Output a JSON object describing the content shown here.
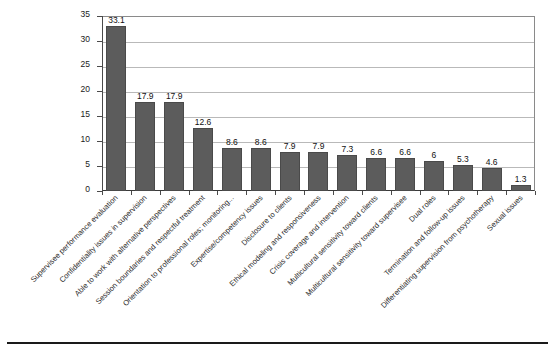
{
  "chart_data": {
    "type": "bar",
    "title": "",
    "subtitle": "",
    "xlabel": "",
    "ylabel": "",
    "ylim": [
      0,
      35
    ],
    "yticks": [
      0,
      5,
      10,
      15,
      20,
      25,
      30,
      35
    ],
    "grid": true,
    "legend": null,
    "orientation": "vertical",
    "bar_color": "#5c5c5c",
    "value_labels": true,
    "categories": [
      "Supervisee performance evaluation",
      "Confidentiality issues in supervision",
      "Able to work with alternative perspectives",
      "Session boundaries and respectful treatment",
      "Orientation to professional roles; monitoring...",
      "Expertise/competency issues",
      "Disclosure to clients",
      "Ethical modeling and responsiveness",
      "Crisis coverage and intervention",
      "Multicultural sensitivity toward clients",
      "Multicultural sensitivity toward supervisee",
      "Dual roles",
      "Termination and follow-up issues",
      "Differentiating supervision from psychotherapy",
      "Sexual issues"
    ],
    "values": [
      33.1,
      17.9,
      17.9,
      12.6,
      8.6,
      8.6,
      7.9,
      7.9,
      7.3,
      6.6,
      6.6,
      6,
      5.3,
      4.6,
      1.3
    ],
    "value_label_text": [
      "33.1",
      "17.9",
      "17.9",
      "12.6",
      "8.6",
      "8.6",
      "7.9",
      "7.9",
      "7.3",
      "6.6",
      "6.6",
      "6",
      "5.3",
      "4.6",
      "1.3"
    ],
    "ytick_labels": [
      "0",
      "5",
      "10",
      "15",
      "20",
      "25",
      "30",
      "35"
    ]
  }
}
